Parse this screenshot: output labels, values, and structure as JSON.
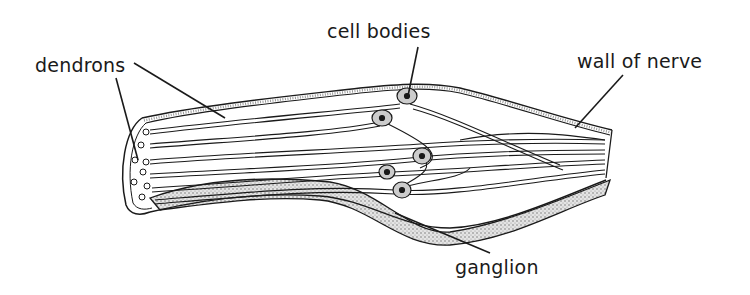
{
  "diagram": {
    "labels": {
      "dendrons": "dendrons",
      "cell_bodies": "cell bodies",
      "wall_of_nerve": "wall of nerve",
      "ganglion": "ganglion"
    },
    "colors": {
      "line": "#1a1a1a",
      "stipple": "#9a9a9a",
      "background": "#ffffff"
    }
  }
}
